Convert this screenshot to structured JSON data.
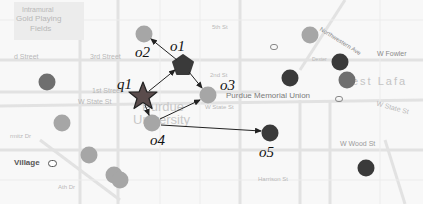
{
  "figure": {
    "type": "spatial query illustration on campus map",
    "colors": {
      "dark_point": "#3a3a3a",
      "medium_point": "#6f6f6f",
      "light_point": "#a6a6a6",
      "star": "#5a4c4c",
      "arrow": "#222222"
    }
  },
  "map_labels": {
    "intramural_1": "Intramural",
    "intramural_2": "Gold Playing",
    "intramural_3": "Fields",
    "street_left": "d Street",
    "third_street": "3rd Street",
    "first_street": "1st Street",
    "fifth_st": "5th St",
    "second_st": "2nd St",
    "w_state_left": "W State St",
    "w_state_mid": "W State St",
    "w_state_right": "W State St",
    "purdue_1": "Purdue",
    "purdue_2": "University",
    "memorial_union": "Purdue Memorial Union",
    "northwestern_ave": "Northwestern Ave",
    "w_fowler": "W Fowler",
    "west_lafayette": "est Lafa",
    "w_wood_st": "W Wood St",
    "harrison_st": "Harrison St",
    "village": "Village",
    "martin_dr": "rmitz Dr",
    "mckutchen_dr": "McCutcheon Dr",
    "s_russell": "S Russell St",
    "s_university": "S University St",
    "marsteller": "Marsteller St",
    "s_chauncey": "S Chauncey Ave",
    "ath_dr": "Ath Dr",
    "dexter": "Dexter"
  },
  "points": [
    {
      "id": "q1",
      "label": "q1",
      "shape": "star",
      "x": 143,
      "y": 96
    },
    {
      "id": "o1",
      "label": "o1",
      "shape": "pentagon",
      "tone": "dark",
      "x": 183,
      "y": 65
    },
    {
      "id": "o2",
      "label": "o2",
      "shape": "circle",
      "tone": "light",
      "x": 144,
      "y": 34
    },
    {
      "id": "o3",
      "label": "o3",
      "shape": "circle",
      "tone": "light",
      "x": 208,
      "y": 95
    },
    {
      "id": "o4",
      "label": "o4",
      "shape": "circle",
      "tone": "light",
      "x": 152,
      "y": 123
    },
    {
      "id": "o5",
      "label": "o5",
      "shape": "circle",
      "tone": "dark",
      "x": 270,
      "y": 133
    },
    {
      "id": "p1",
      "shape": "circle",
      "tone": "medium",
      "x": 47,
      "y": 82
    },
    {
      "id": "p2",
      "shape": "circle",
      "tone": "light",
      "x": 62,
      "y": 123
    },
    {
      "id": "p3",
      "shape": "circle",
      "tone": "light",
      "x": 89,
      "y": 155
    },
    {
      "id": "p4",
      "shape": "circle",
      "tone": "light",
      "x": 114,
      "y": 175
    },
    {
      "id": "p5",
      "shape": "circle",
      "tone": "light",
      "x": 120,
      "y": 180
    },
    {
      "id": "p6",
      "shape": "circle",
      "tone": "light",
      "x": 310,
      "y": 35
    },
    {
      "id": "p7",
      "shape": "circle",
      "tone": "dark",
      "x": 290,
      "y": 78
    },
    {
      "id": "p8",
      "shape": "circle",
      "tone": "dark",
      "x": 340,
      "y": 62
    },
    {
      "id": "p9",
      "shape": "circle",
      "tone": "medium",
      "x": 347,
      "y": 80
    },
    {
      "id": "p10",
      "shape": "circle",
      "tone": "dark",
      "x": 366,
      "y": 168
    }
  ],
  "edges": [
    {
      "from": "q1",
      "to": "o1"
    },
    {
      "from": "o1",
      "to": "o2"
    },
    {
      "from": "o1",
      "to": "o3"
    },
    {
      "from": "q1",
      "to": "o4"
    },
    {
      "from": "o4",
      "to": "o3"
    },
    {
      "from": "o4",
      "to": "o5"
    }
  ]
}
